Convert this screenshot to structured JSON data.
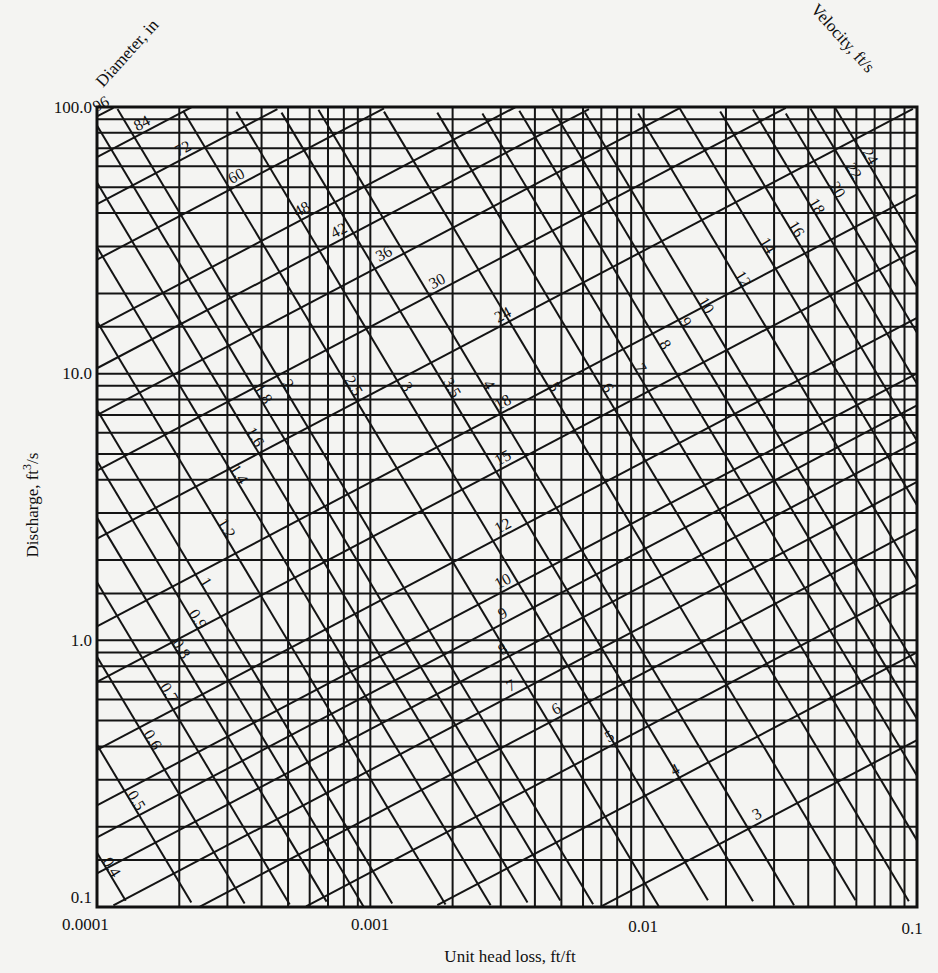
{
  "chart_data": {
    "type": "line",
    "subtype": "nomograph (log-log pipe flow chart)",
    "title": "",
    "xlabel": "Unit head loss, ft/ft",
    "ylabel": "Discharge, ft³/s",
    "xscale": "log",
    "yscale": "log",
    "xlim": [
      0.0001,
      0.1
    ],
    "ylim": [
      0.1,
      100.0
    ],
    "x_tick_labels": [
      "0.0001",
      "0.001",
      "0.01",
      "0.1"
    ],
    "y_tick_labels": [
      "0.1",
      "1.0",
      "10.0",
      "100.0"
    ],
    "grid": true,
    "diameter_family": {
      "label": "Diameter, in",
      "direction": "rising",
      "values": [
        96,
        84,
        72,
        60,
        48,
        42,
        36,
        30,
        24,
        18,
        15,
        12,
        10,
        9,
        8,
        7,
        6,
        5,
        4,
        3
      ]
    },
    "velocity_family": {
      "label": "Velocity, ft/s",
      "direction": "falling",
      "values": [
        24.0,
        22,
        20,
        18,
        16,
        14,
        12,
        10,
        9,
        8,
        7,
        6,
        5,
        4,
        3.5,
        3,
        2.5,
        2,
        1.8,
        1.6,
        1.4,
        1.2,
        1,
        0.9,
        0.8,
        0.7,
        0.6,
        0.5,
        0.4
      ]
    },
    "hazen_williams_C": 130
  },
  "labels": {
    "x_title": "Unit head loss, ft/ft",
    "y_title_main": "Discharge, ft",
    "y_title_sup": "3",
    "y_title_end": "/s",
    "diameter_title": "Diameter, in",
    "velocity_title": "Velocity, ft/s"
  },
  "colors": {
    "ink": "#141414",
    "paper": "#f4f4f2"
  }
}
